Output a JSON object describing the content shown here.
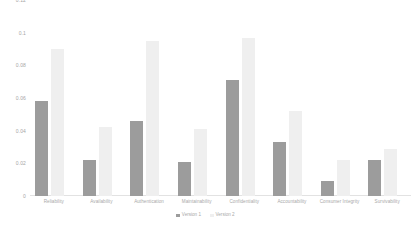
{
  "chart_data": {
    "type": "bar",
    "title": "",
    "subtitle": "",
    "xlabel": "",
    "ylabel": "",
    "ylim": [
      0,
      0.12
    ],
    "yticks": [
      "0",
      "0.02",
      "0.04",
      "0.06",
      "0.08",
      "0.1",
      "0.12"
    ],
    "ytick_values": [
      0,
      0.02,
      0.04,
      0.06,
      0.08,
      0.1,
      0.12
    ],
    "grid": false,
    "legend_position": "bottom",
    "categories": [
      "Reliability",
      "Availability",
      "Authentication",
      "Maintainability",
      "Confidentiality",
      "Accountability",
      "Consumer Integrity",
      "Survivability"
    ],
    "series": [
      {
        "name": "Version 1",
        "color": "#9c9c9c",
        "values": [
          0.058,
          0.022,
          0.046,
          0.021,
          0.071,
          0.033,
          0.009,
          0.022
        ]
      },
      {
        "name": "Version 2",
        "color": "#efefef",
        "values": [
          0.09,
          0.042,
          0.095,
          0.041,
          0.097,
          0.052,
          0.022,
          0.029
        ]
      }
    ]
  },
  "legend": {
    "items": [
      {
        "label": "Version 1",
        "color": "#9c9c9c"
      },
      {
        "label": "Version 2",
        "color": "#efefef"
      }
    ]
  }
}
